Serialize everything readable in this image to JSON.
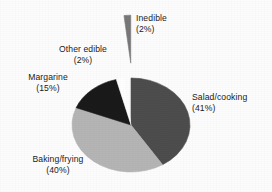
{
  "chart_data": {
    "type": "pie",
    "title": "",
    "subtitle": "",
    "xlabel": "",
    "ylabel": "",
    "legend_position": "none",
    "grid": false,
    "labels_inline": true,
    "categories": [
      "Salad/cooking",
      "Baking/frying",
      "Margarine",
      "Other edible",
      "Inedible"
    ],
    "values": [
      41,
      40,
      15,
      2,
      2
    ],
    "value_unit": "%",
    "slices": [
      {
        "name": "Salad/cooking",
        "value": 41,
        "label_name": "Salad/cooking",
        "label_value": "(41%)",
        "color": "#4d4d4d",
        "exploded": false
      },
      {
        "name": "Baking/frying",
        "value": 40,
        "label_name": "Baking/frying",
        "label_value": "(40%)",
        "color": "#b5b5b5",
        "exploded": false
      },
      {
        "name": "Margarine",
        "value": 15,
        "label_name": "Margarine",
        "label_value": "(15%)",
        "color": "#1a1a1a",
        "exploded": false
      },
      {
        "name": "Other edible",
        "value": 2,
        "label_name": "Other edible",
        "label_value": "(2%)",
        "color": "#ffffff",
        "exploded": false
      },
      {
        "name": "Inedible",
        "value": 2,
        "label_name": "Inedible",
        "label_value": "(2%)",
        "color": "#787878",
        "exploded": true
      }
    ],
    "colors": {
      "salad_cooking": "#4d4d4d",
      "baking_frying": "#b5b5b5",
      "margarine": "#1a1a1a",
      "other_edible": "#ffffff",
      "inedible": "#787878",
      "outline": "#2b2b2b",
      "background": "#fdfdfd",
      "text": "#1b1b1b"
    }
  }
}
